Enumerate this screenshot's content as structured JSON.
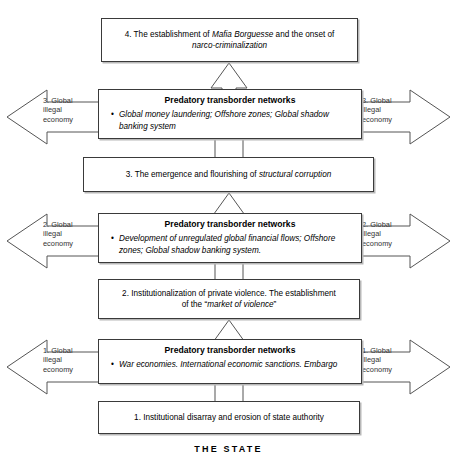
{
  "diagram": {
    "footer_label": "THE STATE",
    "network_title": "Predatory transborder networks",
    "stages": [
      {
        "id": "stage-4",
        "line1_plain_a": "4. The establishment of ",
        "line1_em": "Mafia Borguesse",
        "line1_plain_b": " and the onset of",
        "line2_em": "narco-criminalization"
      },
      {
        "id": "stage-3",
        "line1_plain_a": "3. The emergence and flourishing of ",
        "line1_em": "structural corruption",
        "line1_plain_b": "",
        "line2_em": ""
      },
      {
        "id": "stage-2",
        "line1_plain_a": "2. Institutionalization of private violence. The establishment",
        "line1_em": "",
        "line1_plain_b": "",
        "line2_plain_a": "of the “",
        "line2_em": "market of violence",
        "line2_plain_b": "”"
      },
      {
        "id": "stage-1",
        "line1_plain_a": "1. Institutional disarray and erosion of state authority",
        "line1_em": "",
        "line1_plain_b": "",
        "line2_em": ""
      }
    ],
    "networks": [
      {
        "id": "network-3",
        "title": "Predatory transborder networks",
        "bullet": "Global money laundering; Offshore zones; Global shadow banking system",
        "arrow_label_line1": "3. Global",
        "arrow_label_line2": "illegal",
        "arrow_label_line3": "economy"
      },
      {
        "id": "network-2",
        "title": "Predatory transborder networks",
        "bullet": "Development of unregulated global financial flows; Offshore zones; Global shadow banking system.",
        "arrow_label_line1": "2. Global",
        "arrow_label_line2": "illegal",
        "arrow_label_line3": "economy"
      },
      {
        "id": "network-1",
        "title": "Predatory transborder networks",
        "bullet": "War economies. International economic sanctions.  Embargo",
        "arrow_label_line1": "1. Global",
        "arrow_label_line2": "illegal",
        "arrow_label_line3": "economy"
      }
    ],
    "colors": {
      "stroke": "#3a3a3a",
      "arrow_stroke": "#555555",
      "shadow": "#b8b8b8",
      "background": "#ffffff",
      "text": "#000000"
    }
  }
}
